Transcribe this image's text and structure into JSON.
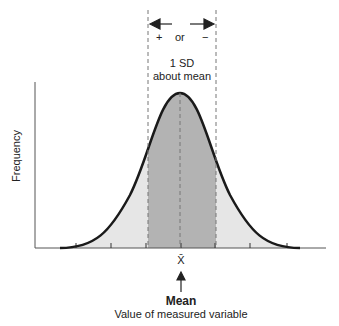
{
  "diagram": {
    "y_axis_label": "Frequency",
    "x_axis_label": "Value of measured variable",
    "mean_symbol": "X̄",
    "mean_label": "Mean",
    "sd_range": {
      "plus": "+",
      "or": "or",
      "minus": "−",
      "line1": "1 SD",
      "line2": "about mean"
    },
    "colors": {
      "curve": "#1a1a1a",
      "sd_region": "#b3b3b3",
      "tail_region": "#e6e6e6",
      "axis": "#555555",
      "dashed": "#777777"
    },
    "tick_count": 7
  }
}
